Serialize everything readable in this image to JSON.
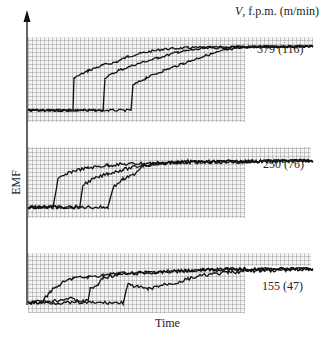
{
  "chart_data": {
    "type": "line",
    "title": "",
    "xlabel": "Time",
    "ylabel": "EMF",
    "legend_title": "V, f.p.m. (m/min)",
    "grid": true,
    "panels": [
      {
        "label": "379 (116)",
        "speed_fpm": 379,
        "speed_m_min": 116,
        "series": [
          {
            "name": "run 1",
            "points": [
              [
                0,
                0.05
              ],
              [
                45,
                0.05
              ],
              [
                46,
                0.5
              ],
              [
                60,
                0.6
              ],
              [
                75,
                0.68
              ],
              [
                88,
                0.72
              ],
              [
                100,
                0.8
              ],
              [
                115,
                0.85
              ],
              [
                135,
                0.9
              ],
              [
                160,
                0.92
              ],
              [
                200,
                0.93
              ],
              [
                285,
                0.94
              ]
            ]
          },
          {
            "name": "run 2",
            "points": [
              [
                0,
                0.05
              ],
              [
                75,
                0.05
              ],
              [
                77,
                0.5
              ],
              [
                90,
                0.6
              ],
              [
                110,
                0.7
              ],
              [
                130,
                0.78
              ],
              [
                150,
                0.86
              ],
              [
                175,
                0.91
              ],
              [
                210,
                0.93
              ],
              [
                285,
                0.94
              ]
            ]
          },
          {
            "name": "run 3",
            "points": [
              [
                0,
                0.05
              ],
              [
                103,
                0.05
              ],
              [
                105,
                0.4
              ],
              [
                118,
                0.5
              ],
              [
                135,
                0.6
              ],
              [
                155,
                0.7
              ],
              [
                175,
                0.8
              ],
              [
                195,
                0.88
              ],
              [
                220,
                0.93
              ],
              [
                285,
                0.94
              ]
            ]
          }
        ]
      },
      {
        "label": "250 (76)",
        "speed_fpm": 250,
        "speed_m_min": 76,
        "series": [
          {
            "name": "run 1",
            "points": [
              [
                0,
                0.05
              ],
              [
                25,
                0.05
              ],
              [
                30,
                0.55
              ],
              [
                45,
                0.7
              ],
              [
                60,
                0.75
              ],
              [
                80,
                0.8
              ],
              [
                110,
                0.83
              ],
              [
                160,
                0.86
              ],
              [
                285,
                0.88
              ]
            ]
          },
          {
            "name": "run 2",
            "points": [
              [
                0,
                0.05
              ],
              [
                52,
                0.05
              ],
              [
                55,
                0.45
              ],
              [
                65,
                0.55
              ],
              [
                80,
                0.65
              ],
              [
                95,
                0.72
              ],
              [
                115,
                0.8
              ],
              [
                150,
                0.85
              ],
              [
                285,
                0.88
              ]
            ]
          },
          {
            "name": "run 3",
            "points": [
              [
                0,
                0.05
              ],
              [
                80,
                0.05
              ],
              [
                85,
                0.4
              ],
              [
                95,
                0.55
              ],
              [
                105,
                0.62
              ],
              [
                115,
                0.8
              ],
              [
                150,
                0.85
              ],
              [
                285,
                0.88
              ]
            ]
          }
        ]
      },
      {
        "label": "155 (47)",
        "speed_fpm": 155,
        "speed_m_min": 47,
        "series": [
          {
            "name": "run 1",
            "points": [
              [
                0,
                0.05
              ],
              [
                15,
                0.08
              ],
              [
                22,
                0.3
              ],
              [
                35,
                0.5
              ],
              [
                45,
                0.6
              ],
              [
                60,
                0.62
              ],
              [
                75,
                0.66
              ],
              [
                90,
                0.7
              ],
              [
                110,
                0.72
              ],
              [
                140,
                0.75
              ],
              [
                180,
                0.78
              ],
              [
                285,
                0.8
              ]
            ]
          },
          {
            "name": "run 2",
            "points": [
              [
                0,
                0.05
              ],
              [
                30,
                0.1
              ],
              [
                40,
                0.15
              ],
              [
                55,
                0.08
              ],
              [
                60,
                0.1
              ],
              [
                62,
                0.35
              ],
              [
                70,
                0.45
              ],
              [
                75,
                0.6
              ],
              [
                90,
                0.68
              ],
              [
                130,
                0.72
              ],
              [
                170,
                0.78
              ],
              [
                200,
                0.8
              ],
              [
                285,
                0.8
              ]
            ]
          },
          {
            "name": "run 3",
            "points": [
              [
                0,
                0.05
              ],
              [
                95,
                0.05
              ],
              [
                100,
                0.45
              ],
              [
                110,
                0.4
              ],
              [
                120,
                0.35
              ],
              [
                135,
                0.45
              ],
              [
                150,
                0.5
              ],
              [
                160,
                0.58
              ],
              [
                175,
                0.66
              ],
              [
                200,
                0.72
              ],
              [
                220,
                0.75
              ],
              [
                285,
                0.8
              ]
            ]
          }
        ]
      }
    ]
  }
}
